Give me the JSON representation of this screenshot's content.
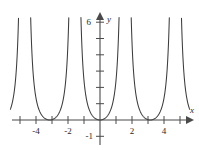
{
  "figure": {
    "title": "",
    "axis_labels": {
      "x": "x",
      "y": "y"
    },
    "y_top_label": "6",
    "y_bottom_label": "-1",
    "x_tick_labels": [
      "-4",
      "-2",
      "2",
      "4"
    ],
    "colors": {
      "curve": "#3c3c3c",
      "axis": "#4a4a4a",
      "text": "#2b2b2b"
    }
  },
  "chart_data": {
    "type": "line",
    "title": "",
    "xlabel": "x",
    "ylabel": "y",
    "xlim": [
      -5.6,
      5.6
    ],
    "ylim": [
      -1.2,
      6.4
    ],
    "grid": false,
    "legend": null,
    "function": "tan^2(x)",
    "period": 3.1416,
    "x_ticks": [
      -5,
      -4,
      -3,
      -2,
      -1,
      1,
      2,
      3,
      4,
      5
    ],
    "x_tick_labels_shown": {
      "-4": "-4",
      "-2": "-2",
      "2": "2",
      "4": "4"
    },
    "y_ticks": [
      1,
      2,
      3,
      4,
      5,
      6
    ],
    "y_tick_labels_shown": {
      "6": "6",
      "-1": "-1"
    },
    "asymptotes": [
      -4.712,
      -1.571,
      1.571,
      4.712
    ],
    "minima": [
      {
        "x": -6.283,
        "y": 0
      },
      {
        "x": -3.142,
        "y": 0
      },
      {
        "x": 0,
        "y": 0
      },
      {
        "x": 3.142,
        "y": 0
      },
      {
        "x": 6.283,
        "y": 0
      }
    ],
    "series": [
      {
        "name": "tan^2(x)",
        "x": [
          -5.6,
          -5.5,
          -5.4,
          -5.3,
          -5.2,
          -5.1,
          -5.0,
          -4.9,
          -4.85,
          -4.8,
          -4.62,
          -4.57,
          -4.52,
          -4.42,
          -4.32,
          -4.22,
          -4.12,
          -4.02,
          -3.92,
          -3.82,
          -3.72,
          -3.62,
          -3.52,
          -3.42,
          -3.32,
          -3.22,
          -3.14,
          -3.06,
          -2.96,
          -2.86,
          -2.76,
          -2.66,
          -2.56,
          -2.46,
          -2.36,
          -2.26,
          -2.16,
          -2.06,
          -1.96,
          -1.86,
          -1.76,
          -1.71,
          -1.66,
          -1.48,
          -1.43,
          -1.38,
          -1.28,
          -1.18,
          -1.08,
          -0.98,
          -0.88,
          -0.78,
          -0.68,
          -0.58,
          -0.48,
          -0.38,
          -0.28,
          -0.18,
          -0.08,
          0.0,
          0.08,
          0.18,
          0.28,
          0.38,
          0.48,
          0.58,
          0.68,
          0.78,
          0.88,
          0.98,
          1.08,
          1.18,
          1.28,
          1.38,
          1.43,
          1.48,
          1.66,
          1.71,
          1.76,
          1.86,
          1.96,
          2.06,
          2.16,
          2.26,
          2.36,
          2.46,
          2.56,
          2.66,
          2.76,
          2.86,
          2.96,
          3.06,
          3.14,
          3.22,
          3.32,
          3.42,
          3.52,
          3.62,
          3.72,
          3.82,
          3.92,
          4.02,
          4.12,
          4.22,
          4.32,
          4.42,
          4.52,
          4.57,
          4.62,
          4.8,
          4.85,
          4.9,
          5.0,
          5.1,
          5.2,
          5.3,
          5.4,
          5.5,
          5.6
        ],
        "y": [
          0.41,
          0.21,
          0.09,
          0.02,
          0.0,
          0.02,
          0.09,
          0.21,
          0.3,
          0.41,
          6.0,
          6.0,
          6.0,
          2.0,
          0.9,
          0.52,
          0.3,
          0.18,
          0.1,
          0.05,
          0.02,
          0.0,
          0.01,
          0.03,
          0.08,
          0.16,
          0.25,
          0.36,
          0.6,
          0.95,
          1.5,
          2.4,
          4.0,
          6.0,
          6.0,
          6.0,
          6.0,
          6.0,
          6.0,
          6.0,
          6.0,
          6.0,
          6.0,
          6.0,
          6.0,
          6.0,
          6.0,
          5.6,
          3.2,
          2.1,
          1.45,
          0.98,
          0.63,
          0.4,
          0.26,
          0.16,
          0.08,
          0.03,
          0.01,
          0.0,
          0.01,
          0.03,
          0.08,
          0.16,
          0.26,
          0.4,
          0.63,
          0.98,
          1.45,
          2.1,
          3.2,
          5.6,
          6.0,
          6.0,
          6.0,
          6.0,
          6.0,
          6.0,
          6.0,
          6.0,
          6.0,
          6.0,
          6.0,
          6.0,
          6.0,
          6.0,
          4.0,
          2.4,
          1.5,
          0.95,
          0.6,
          0.36,
          0.25,
          0.16,
          0.08,
          0.03,
          0.01,
          0.0,
          0.02,
          0.05,
          0.1,
          0.18,
          0.3,
          0.52,
          0.9,
          2.0,
          6.0,
          6.0,
          6.0,
          0.41,
          0.3,
          0.21,
          0.09,
          0.02,
          0.0,
          0.02,
          0.09,
          0.21,
          0.41
        ]
      }
    ]
  }
}
